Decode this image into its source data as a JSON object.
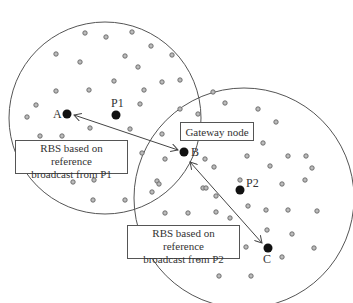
{
  "diagram": {
    "type": "network-diagram",
    "colors": {
      "line": "#555555",
      "node": "#111111",
      "sensor_fill": "#bbbbbb",
      "sensor_stroke": "#666666"
    },
    "circles": [
      {
        "id": "region-p1",
        "cx": 105,
        "cy": 118,
        "r": 96
      },
      {
        "id": "region-p2",
        "cx": 244,
        "cy": 198,
        "r": 110
      }
    ],
    "nodes": [
      {
        "id": "A",
        "label": "A",
        "x": 67,
        "y": 114
      },
      {
        "id": "P1",
        "label": "P1",
        "x": 116,
        "y": 115
      },
      {
        "id": "B",
        "label": "B",
        "x": 184,
        "y": 152
      },
      {
        "id": "P2",
        "label": "P2",
        "x": 240,
        "y": 190
      },
      {
        "id": "C",
        "label": "C",
        "x": 268,
        "y": 248
      }
    ],
    "labels": {
      "gateway": "Gateway node",
      "rbs_p1_line1": "RBS based on reference",
      "rbs_p1_line2": "broadcast from P1",
      "rbs_p2_line1": "RBS based on reference",
      "rbs_p2_line2": "broadcast from P2"
    },
    "sensors": [
      [
        85,
        33
      ],
      [
        106,
        37
      ],
      [
        132,
        32
      ],
      [
        151,
        46
      ],
      [
        172,
        55
      ],
      [
        56,
        54
      ],
      [
        80,
        62
      ],
      [
        125,
        56
      ],
      [
        138,
        67
      ],
      [
        114,
        81
      ],
      [
        162,
        82
      ],
      [
        180,
        80
      ],
      [
        56,
        91
      ],
      [
        89,
        90
      ],
      [
        144,
        90
      ],
      [
        36,
        105
      ],
      [
        27,
        117
      ],
      [
        140,
        104
      ],
      [
        90,
        128
      ],
      [
        130,
        129
      ],
      [
        162,
        134
      ],
      [
        40,
        136
      ],
      [
        62,
        136
      ],
      [
        142,
        153
      ],
      [
        165,
        159
      ],
      [
        121,
        171
      ],
      [
        73,
        182
      ],
      [
        94,
        180
      ],
      [
        157,
        181
      ],
      [
        159,
        184
      ],
      [
        152,
        192
      ],
      [
        93,
        200
      ],
      [
        125,
        200
      ],
      [
        180,
        109
      ],
      [
        198,
        114
      ],
      [
        213,
        92
      ],
      [
        225,
        103
      ],
      [
        258,
        109
      ],
      [
        276,
        122
      ],
      [
        263,
        143
      ],
      [
        205,
        159
      ],
      [
        247,
        156
      ],
      [
        288,
        156
      ],
      [
        270,
        166
      ],
      [
        306,
        156
      ],
      [
        312,
        168
      ],
      [
        214,
        167
      ],
      [
        240,
        180
      ],
      [
        203,
        188
      ],
      [
        206,
        188
      ],
      [
        216,
        196
      ],
      [
        282,
        184
      ],
      [
        305,
        180
      ],
      [
        165,
        213
      ],
      [
        188,
        213
      ],
      [
        248,
        206
      ],
      [
        216,
        212
      ],
      [
        266,
        210
      ],
      [
        288,
        210
      ],
      [
        317,
        211
      ],
      [
        267,
        230
      ],
      [
        292,
        234
      ],
      [
        246,
        247
      ],
      [
        314,
        248
      ],
      [
        198,
        258
      ],
      [
        220,
        256
      ],
      [
        282,
        257
      ],
      [
        219,
        276
      ],
      [
        251,
        276
      ],
      [
        230,
        218
      ],
      [
        168,
        233
      ]
    ]
  }
}
